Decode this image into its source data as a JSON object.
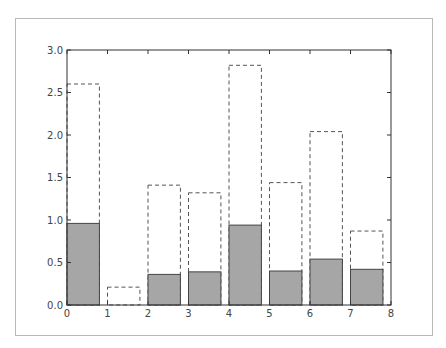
{
  "chart_data": {
    "type": "bar",
    "title": "",
    "xlabel": "",
    "ylabel": "",
    "xlim": [
      0,
      8
    ],
    "ylim": [
      0,
      3.0
    ],
    "grid": false,
    "bar_width": 0.8,
    "x": [
      0,
      1,
      2,
      3,
      4,
      5,
      6,
      7
    ],
    "x_ticks": [
      "0",
      "1",
      "2",
      "3",
      "4",
      "5",
      "6",
      "7",
      "8"
    ],
    "y_ticks": [
      "0.0",
      "0.5",
      "1.0",
      "1.5",
      "2.0",
      "2.5",
      "3.0"
    ],
    "series": [
      {
        "name": "outline (dashed, unfilled)",
        "style": "dashed",
        "fill": "none",
        "edge_color": "#555555",
        "values": [
          2.6,
          0.21,
          1.41,
          1.32,
          2.82,
          1.44,
          2.04,
          0.87
        ]
      },
      {
        "name": "filled (gray)",
        "style": "solid",
        "fill": "#a6a6a6",
        "edge_color": "#444444",
        "values": [
          0.96,
          0.0,
          0.36,
          0.39,
          0.94,
          0.4,
          0.54,
          0.42
        ]
      }
    ]
  }
}
